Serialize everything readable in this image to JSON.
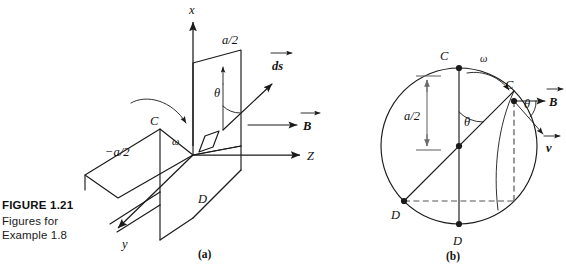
{
  "figure": {
    "caption_title": "FIGURE 1.21",
    "caption_line1": "Figures for",
    "caption_line2": "Example 1.8",
    "subcaption_a": "(a)",
    "subcaption_b": "(b)",
    "ink_color": "#1a1a1a",
    "dash_color": "#555555"
  },
  "panel_a": {
    "title": "Rotating rectangular loop in a uniform magnetic field (3-D perspective view)",
    "axis_x_label": "x",
    "axis_y_label": "y",
    "axis_z_label": "Z",
    "label_a_over_2": "a/2",
    "label_neg_a_over_2": "−a/2",
    "label_ds": "ds",
    "label_B": "B",
    "label_theta": "θ",
    "label_omega": "ω",
    "label_C": "C",
    "label_D": "D"
  },
  "panel_b": {
    "title": "End-on view of the rotating loop showing velocity and field directions",
    "label_C_top": "C",
    "label_C_right": "C",
    "label_D_left": "D",
    "label_D_bottom": "D",
    "label_omega": "ω",
    "label_theta_center": "θ",
    "label_theta_right": "θ",
    "label_a_over_2": "a/2",
    "label_B": "B",
    "label_v": "v",
    "circle_center_x": 459,
    "circle_center_y": 146,
    "circle_radius": 78
  }
}
